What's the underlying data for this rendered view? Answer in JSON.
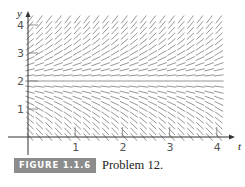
{
  "chart_data": {
    "type": "direction_field",
    "title": "",
    "xlabel": "t",
    "ylabel": "y",
    "xlim": [
      0,
      4
    ],
    "ylim": [
      0,
      4.2
    ],
    "x_ticks": [
      1,
      2,
      3,
      4
    ],
    "y_ticks": [
      1,
      2,
      3,
      4
    ],
    "x_tick_labels": [
      "1",
      "2",
      "3",
      "4"
    ],
    "y_tick_labels": [
      "1",
      "2",
      "3",
      "4"
    ],
    "grid": false,
    "equilibrium_y": 2,
    "sample_spacing": {
      "t": 0.2,
      "y": 0.2
    }
  },
  "figure": {
    "badge": "FIGURE 1.1.6",
    "caption": "Problem 12."
  },
  "colors": {
    "segment": "#8a8a8a",
    "axis": "#333333",
    "badge_bg": "#8c8c8c"
  }
}
